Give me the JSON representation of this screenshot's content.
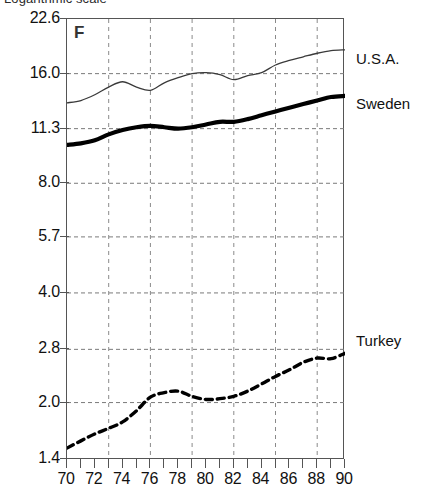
{
  "figure": {
    "title_clipped": "Logarithmic scale",
    "panel_letter": "F"
  },
  "chart_data": {
    "type": "line",
    "title": "Logarithmic scale",
    "xlabel": "",
    "ylabel": "",
    "yscale": "log",
    "grid": true,
    "legend_position": "right-inline",
    "xlim": [
      70,
      90
    ],
    "ylim": [
      1.4,
      22.6
    ],
    "ytick_labels": [
      "22.6",
      "16.0",
      "11.3",
      "8.0",
      "5.7",
      "4.0",
      "2.8",
      "2.0",
      "1.4"
    ],
    "ytick_values": [
      22.6,
      16.0,
      11.3,
      8.0,
      5.7,
      4.0,
      2.8,
      2.0,
      1.4
    ],
    "xtick_labels": [
      "70",
      "72",
      "74",
      "76",
      "78",
      "80",
      "82",
      "84",
      "86",
      "88",
      "90"
    ],
    "xtick_values": [
      70,
      72,
      74,
      76,
      78,
      80,
      82,
      84,
      86,
      88,
      90
    ],
    "xtick_minor": [
      71,
      73,
      75,
      77,
      79,
      81,
      83,
      85,
      87,
      89
    ],
    "x_gridlines": [
      73,
      76,
      79,
      82,
      85,
      88
    ],
    "x": [
      70,
      71,
      72,
      73,
      74,
      75,
      76,
      77,
      78,
      79,
      80,
      81,
      82,
      83,
      84,
      85,
      86,
      87,
      88,
      89,
      90
    ],
    "series": [
      {
        "name": "U.S.A.",
        "style": "thin-solid",
        "color": "#3a3a3a",
        "label_y_value": 17.6,
        "values": [
          13.3,
          13.5,
          14.0,
          14.7,
          15.2,
          14.7,
          14.4,
          15.1,
          15.6,
          16.0,
          16.1,
          15.9,
          15.4,
          15.8,
          16.1,
          16.9,
          17.4,
          17.8,
          18.2,
          18.5,
          18.6
        ]
      },
      {
        "name": "Sweden",
        "style": "thick-solid",
        "color": "#000000",
        "label_y_value": 13.2,
        "values": [
          10.2,
          10.3,
          10.5,
          10.9,
          11.2,
          11.4,
          11.5,
          11.4,
          11.3,
          11.4,
          11.6,
          11.8,
          11.8,
          12.0,
          12.3,
          12.6,
          12.9,
          13.2,
          13.5,
          13.8,
          13.9
        ]
      },
      {
        "name": "Turkey",
        "style": "dashed",
        "color": "#000000",
        "label_y_value": 2.95,
        "values": [
          1.5,
          1.57,
          1.64,
          1.7,
          1.77,
          1.9,
          2.07,
          2.13,
          2.15,
          2.08,
          2.04,
          2.05,
          2.08,
          2.15,
          2.25,
          2.36,
          2.46,
          2.58,
          2.65,
          2.64,
          2.73
        ]
      }
    ]
  }
}
